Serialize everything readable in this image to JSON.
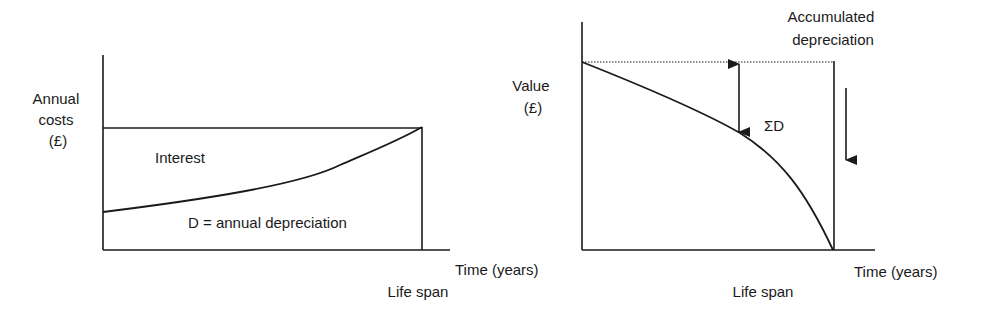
{
  "diagrams": [
    {
      "id": "annual-costs",
      "y_axis_label": [
        "Annual",
        "costs",
        "(£)"
      ],
      "x_axis_label": "Time (years)",
      "marker_label": "Life span",
      "region_labels": {
        "upper": "Interest",
        "lower": "D = annual depreciation"
      },
      "description": "Annual costs constant over life span; depreciation portion rises over time while interest portion falls."
    },
    {
      "id": "value",
      "y_axis_label": [
        "Value",
        "(£)"
      ],
      "x_axis_label": "Time (years)",
      "marker_label": "Life span",
      "top_label": [
        "Accumulated",
        "depreciation"
      ],
      "gap_label": "ΣD",
      "description": "Asset value declines from initial value to zero at end of life span; gap from initial value is accumulated depreciation."
    }
  ],
  "colors": {
    "ink": "#1a1a1a",
    "background": "#ffffff"
  }
}
